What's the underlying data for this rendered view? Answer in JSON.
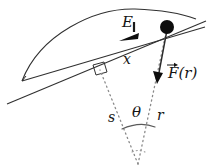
{
  "figure": {
    "kind": "physics-force-diagram",
    "title": "",
    "colors": {
      "stroke": "#303030",
      "dotted": "#8a8a8a",
      "fill_black": "#0d0d0d",
      "background": "#ffffff"
    },
    "labels": {
      "field_E": "E",
      "distance_x": "x",
      "arc_length_s": "s",
      "angle_theta": "θ",
      "radius_r": "r",
      "force_F_base": "F",
      "force_F_arg": "(r)"
    },
    "annotations": {
      "right_angle_marker": "right-angle",
      "particle": "point-mass",
      "field_direction_arrow": "leftward-along-line",
      "force_direction_arrow": "downward-toward-center"
    }
  }
}
